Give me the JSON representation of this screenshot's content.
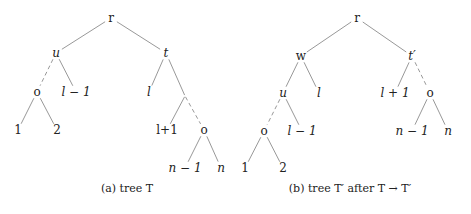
{
  "figures": [
    {
      "id": "a",
      "caption_prefix": "(a) tree ",
      "caption_math": "T",
      "caption_suffix": "",
      "nodes": [
        {
          "id": "r",
          "label": "r",
          "italic": false
        },
        {
          "id": "u",
          "label": "u",
          "italic": true
        },
        {
          "id": "t",
          "label": "t",
          "italic": true
        },
        {
          "id": "o1",
          "label": "o",
          "italic": false
        },
        {
          "id": "lm1",
          "label": "l − 1",
          "italic": true
        },
        {
          "id": "l",
          "label": "l",
          "italic": true
        },
        {
          "id": "j",
          "label": "",
          "italic": false
        },
        {
          "id": "n1",
          "label": "1",
          "italic": false
        },
        {
          "id": "n2",
          "label": "2",
          "italic": false
        },
        {
          "id": "lp1",
          "label": "l+1",
          "italic": false
        },
        {
          "id": "o2",
          "label": "o",
          "italic": false
        },
        {
          "id": "nm1",
          "label": "n − 1",
          "italic": true
        },
        {
          "id": "n",
          "label": "n",
          "italic": true
        }
      ],
      "edges": [
        {
          "from": "r",
          "to": "u",
          "style": "solid"
        },
        {
          "from": "r",
          "to": "t",
          "style": "solid"
        },
        {
          "from": "u",
          "to": "o1",
          "style": "dashed"
        },
        {
          "from": "u",
          "to": "lm1",
          "style": "solid"
        },
        {
          "from": "t",
          "to": "l",
          "style": "solid"
        },
        {
          "from": "t",
          "to": "j",
          "style": "solid"
        },
        {
          "from": "o1",
          "to": "n1",
          "style": "solid"
        },
        {
          "from": "o1",
          "to": "n2",
          "style": "solid"
        },
        {
          "from": "j",
          "to": "lp1",
          "style": "solid"
        },
        {
          "from": "j",
          "to": "o2",
          "style": "dashed"
        },
        {
          "from": "o2",
          "to": "nm1",
          "style": "solid"
        },
        {
          "from": "o2",
          "to": "n",
          "style": "solid"
        }
      ]
    },
    {
      "id": "b",
      "caption_prefix": "(b) tree ",
      "caption_math": "T′ after T → T′",
      "caption_suffix": "",
      "nodes": [
        {
          "id": "r",
          "label": "r",
          "italic": false
        },
        {
          "id": "w",
          "label": "w",
          "italic": false
        },
        {
          "id": "tp",
          "label": "t′",
          "italic": true
        },
        {
          "id": "u",
          "label": "u",
          "italic": true
        },
        {
          "id": "l",
          "label": "l",
          "italic": true
        },
        {
          "id": "lp1",
          "label": "l + 1",
          "italic": true
        },
        {
          "id": "o2",
          "label": "o",
          "italic": false
        },
        {
          "id": "o1",
          "label": "o",
          "italic": false
        },
        {
          "id": "lm1",
          "label": "l − 1",
          "italic": true
        },
        {
          "id": "nm1",
          "label": "n − 1",
          "italic": true
        },
        {
          "id": "n",
          "label": "n",
          "italic": true
        },
        {
          "id": "n1",
          "label": "1",
          "italic": false
        },
        {
          "id": "n2",
          "label": "2",
          "italic": false
        }
      ],
      "edges": [
        {
          "from": "r",
          "to": "w",
          "style": "solid"
        },
        {
          "from": "r",
          "to": "tp",
          "style": "solid"
        },
        {
          "from": "w",
          "to": "u",
          "style": "solid"
        },
        {
          "from": "w",
          "to": "l",
          "style": "solid"
        },
        {
          "from": "tp",
          "to": "lp1",
          "style": "solid"
        },
        {
          "from": "tp",
          "to": "o2",
          "style": "dashed"
        },
        {
          "from": "u",
          "to": "o1",
          "style": "dashed"
        },
        {
          "from": "u",
          "to": "lm1",
          "style": "solid"
        },
        {
          "from": "o2",
          "to": "nm1",
          "style": "solid"
        },
        {
          "from": "o2",
          "to": "n",
          "style": "solid"
        },
        {
          "from": "o1",
          "to": "n1",
          "style": "solid"
        },
        {
          "from": "o1",
          "to": "n2",
          "style": "solid"
        }
      ]
    }
  ],
  "captions": {
    "a": "(a) tree T",
    "b": "(b) tree T′ after T → T′"
  }
}
